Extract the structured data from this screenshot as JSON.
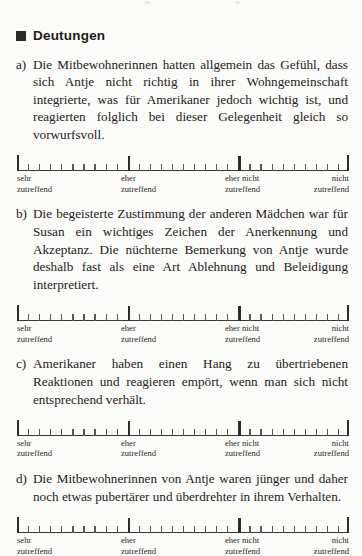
{
  "document": {
    "section_heading": "Deutungen",
    "bullet_icon": "filled-square-bullet"
  },
  "scale": {
    "segments": 3,
    "minor_ticks_per_segment": 9,
    "labels": [
      {
        "line1": "sehr",
        "line2": "zutreffend"
      },
      {
        "line1": "eher",
        "line2": "zutreffend"
      },
      {
        "line1": "eher nicht",
        "line2": "zutreffend"
      },
      {
        "line1": "nicht",
        "line2": "zutreffend"
      }
    ]
  },
  "items": [
    {
      "marker": "a)",
      "text": "Die Mitbewohnerinnen hatten allgemein das Gefühl, dass sich Antje nicht richtig in ihrer Wohngemeinschaft integrierte, was für Amerikaner jedoch wichtig ist, und reagierten folglich bei dieser Gelegenheit gleich so vorwurfsvoll."
    },
    {
      "marker": "b)",
      "text": "Die begeisterte Zustimmung der anderen Mädchen war für Susan ein wichtiges Zeichen der Anerkennung und Akzeptanz. Die nüchterne Bemerkung von Antje wurde deshalb fast als eine Art Ablehnung und Beleidigung interpretiert."
    },
    {
      "marker": "c)",
      "text": "Amerikaner haben einen Hang zu übertriebenen Reaktionen und reagieren empört, wenn man sich nicht entsprechend ver­hält."
    },
    {
      "marker": "d)",
      "text": "Die Mitbewohnerinnen von Antje waren jünger und daher noch etwas pubertärer und überdrehter in ihrem Verhalten."
    }
  ],
  "colors": {
    "page_background": "#fbfbf9",
    "text": "#232120",
    "rule": "#2e2b29",
    "tick_minor": "#5a5653"
  }
}
